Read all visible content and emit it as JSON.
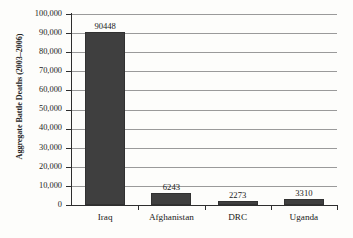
{
  "chart_data": {
    "type": "bar",
    "title": "",
    "xlabel": "",
    "ylabel": "Aggregate Battle Deaths (2003–2006)",
    "categories": [
      "Iraq",
      "Afghanistan",
      "DRC",
      "Uganda"
    ],
    "values": [
      90448,
      6243,
      2273,
      3310
    ],
    "value_labels": [
      "90448",
      "6243",
      "2273",
      "3310"
    ],
    "ylim": [
      0,
      100000
    ],
    "ytick_step": 10000,
    "ytick_labels": [
      "100,000",
      "90,000",
      "80,000",
      "70,000",
      "60,000",
      "50,000",
      "40,000",
      "30,000",
      "20,000",
      "10,000",
      "0"
    ],
    "ytick_values": [
      100000,
      90000,
      80000,
      70000,
      60000,
      50000,
      40000,
      30000,
      20000,
      10000,
      0
    ],
    "grid": true,
    "grid_axis": "y",
    "legend": false,
    "legend_position": "none",
    "bar_color": "#3f3f3f",
    "gridline_color": "#9a9a9a",
    "axis_color": "#2e2e2e",
    "background_color": "#fdfdfb",
    "text_color": "#1a1a1a"
  }
}
